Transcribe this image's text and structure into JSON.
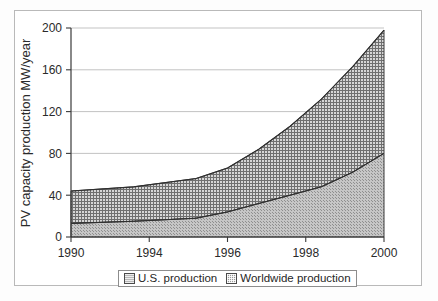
{
  "chart_data": {
    "type": "area",
    "stacked": true,
    "title": "",
    "subtitle": "",
    "xlabel": "",
    "ylabel": "PV capacity production MW/year",
    "categories": [
      "1990",
      "1994",
      "1996",
      "1998",
      "2000"
    ],
    "x_tick_labels": [
      "1990",
      "1994",
      "1996",
      "1998",
      "2000"
    ],
    "y_tick_labels": [
      "0",
      "40",
      "80",
      "120",
      "160",
      "200"
    ],
    "y_ticks": [
      0,
      40,
      80,
      120,
      160,
      200
    ],
    "ylim": [
      0,
      200
    ],
    "grid": "horizontal",
    "legend_position": "bottom",
    "series": [
      {
        "name": "U.S. production",
        "fill": "#b8b8b8",
        "pattern": "stipple",
        "values": [
          13,
          18,
          32,
          48,
          80
        ]
      },
      {
        "name": "Worldwide production",
        "fill": "#9a9a9a",
        "pattern": "crosshatch",
        "values": [
          44,
          56,
          84,
          132,
          198
        ]
      }
    ],
    "series_detail_x": [
      1990,
      1992,
      1994,
      1995,
      1996,
      1997,
      1998,
      1999,
      2000
    ],
    "series_detail": [
      {
        "name": "U.S. production",
        "values": [
          13,
          15,
          18,
          24,
          32,
          40,
          48,
          62,
          80
        ]
      },
      {
        "name": "Worldwide production",
        "values": [
          44,
          48,
          56,
          66,
          84,
          106,
          132,
          163,
          198
        ]
      }
    ]
  },
  "legend": {
    "entries": [
      {
        "label": "U.S. production"
      },
      {
        "label": "Worldwide production"
      }
    ]
  },
  "axes": {
    "y_axis_label": "PV capacity production MW/year",
    "y_ticks": [
      "200",
      "160",
      "120",
      "80",
      "40",
      "0"
    ],
    "x_ticks": [
      "1990",
      "1994",
      "1996",
      "1998",
      "2000"
    ]
  },
  "colors": {
    "us_fill": "#b8b8b8",
    "worldwide_fill": "#9a9a9a",
    "axis": "#3a3a3a",
    "grid": "#a9a9a9",
    "frame": "#b9b9b9"
  }
}
